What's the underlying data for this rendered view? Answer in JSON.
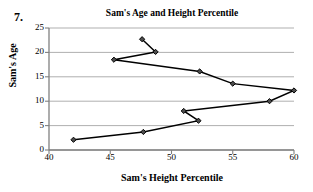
{
  "question_number": "7.",
  "chart_data": {
    "type": "line",
    "title": "Sam's Age and Height Percentile",
    "xlabel": "Sam's Height Percentile",
    "ylabel": "Sam's Age",
    "xlim": [
      40,
      60
    ],
    "ylim": [
      0,
      25
    ],
    "xticks": [
      40,
      45,
      50,
      55,
      60
    ],
    "yticks": [
      0,
      5,
      10,
      15,
      20,
      25
    ],
    "grid": "horizontal",
    "legend": "none",
    "marker": "diamond",
    "line_color": "#000000",
    "grid_color": "#a6a6a6",
    "axis_color": "#808080",
    "points": [
      {
        "x": 42.0,
        "y": 2.1
      },
      {
        "x": 47.7,
        "y": 3.7
      },
      {
        "x": 52.2,
        "y": 6.0
      },
      {
        "x": 51.0,
        "y": 8.0
      },
      {
        "x": 58.0,
        "y": 10.0
      },
      {
        "x": 60.0,
        "y": 12.2
      },
      {
        "x": 55.0,
        "y": 13.6
      },
      {
        "x": 52.3,
        "y": 16.1
      },
      {
        "x": 45.3,
        "y": 18.5
      },
      {
        "x": 48.7,
        "y": 20.1
      },
      {
        "x": 47.6,
        "y": 22.7
      }
    ],
    "x_values": [
      42.0,
      47.7,
      52.2,
      51.0,
      58.0,
      60.0,
      55.0,
      52.3,
      45.3,
      48.7,
      47.6
    ],
    "y_values": [
      2.1,
      3.7,
      6.0,
      8.0,
      10.0,
      12.2,
      13.6,
      16.1,
      18.5,
      20.1,
      22.7
    ]
  }
}
